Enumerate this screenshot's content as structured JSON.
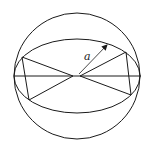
{
  "diagram": {
    "label_radius": "a",
    "stroke_color": "#1a1a1a",
    "background": "#ffffff"
  }
}
